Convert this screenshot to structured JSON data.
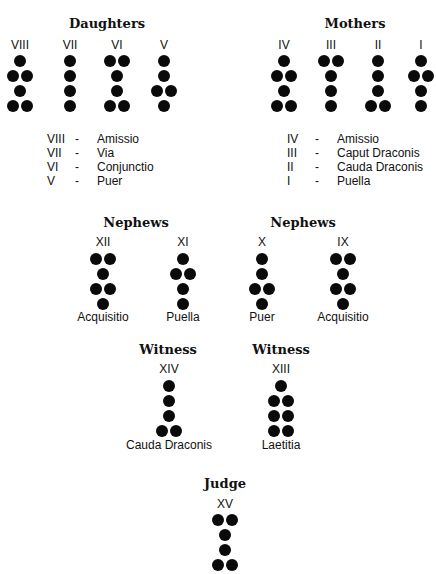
{
  "groups": {
    "daughters": {
      "title": "Daughters",
      "figures": [
        {
          "numeral": "VIII",
          "rows": [
            1,
            2,
            1,
            2
          ],
          "name": "Amissio"
        },
        {
          "numeral": "VII",
          "rows": [
            1,
            1,
            1,
            1
          ],
          "name": "Via"
        },
        {
          "numeral": "VI",
          "rows": [
            2,
            1,
            1,
            2
          ],
          "name": "Conjunctio"
        },
        {
          "numeral": "V",
          "rows": [
            1,
            1,
            2,
            1
          ],
          "name": "Puer"
        }
      ]
    },
    "mothers": {
      "title": "Mothers",
      "figures": [
        {
          "numeral": "IV",
          "rows": [
            1,
            2,
            1,
            2
          ],
          "name": "Amissio"
        },
        {
          "numeral": "III",
          "rows": [
            2,
            1,
            1,
            1
          ],
          "name": "Caput Draconis"
        },
        {
          "numeral": "II",
          "rows": [
            1,
            1,
            1,
            2
          ],
          "name": "Cauda Draconis"
        },
        {
          "numeral": "I",
          "rows": [
            1,
            2,
            1,
            1
          ],
          "name": "Puella"
        }
      ]
    },
    "nephews_left": {
      "title": "Nephews",
      "figures": [
        {
          "numeral": "XII",
          "rows": [
            2,
            1,
            2,
            1
          ],
          "name": "Acquisitio"
        },
        {
          "numeral": "XI",
          "rows": [
            1,
            2,
            1,
            1
          ],
          "name": "Puella"
        }
      ]
    },
    "nephews_right": {
      "title": "Nephews",
      "figures": [
        {
          "numeral": "X",
          "rows": [
            1,
            1,
            2,
            1
          ],
          "name": "Puer"
        },
        {
          "numeral": "IX",
          "rows": [
            2,
            1,
            2,
            1
          ],
          "name": "Acquisitio"
        }
      ]
    },
    "witness_left": {
      "title": "Witness",
      "figures": [
        {
          "numeral": "XIV",
          "rows": [
            1,
            1,
            1,
            2
          ],
          "name": "Cauda Draconis"
        }
      ]
    },
    "witness_right": {
      "title": "Witness",
      "figures": [
        {
          "numeral": "XIII",
          "rows": [
            1,
            2,
            2,
            2
          ],
          "name": "Laetitia"
        }
      ]
    },
    "judge": {
      "title": "Judge",
      "figures": [
        {
          "numeral": "XV",
          "rows": [
            2,
            1,
            1,
            2
          ],
          "name": ""
        }
      ]
    }
  },
  "legend_dash": "-"
}
